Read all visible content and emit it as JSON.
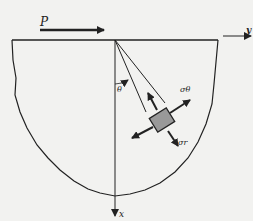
{
  "diagram": {
    "title": "",
    "labels": {
      "load": "P",
      "y_axis": "y",
      "x_axis": "x",
      "angle": "θ",
      "sigma_theta": "σθ",
      "sigma_r": "σr"
    },
    "colors": {
      "background": "#f2f2f0",
      "line": "#222222",
      "element_fill": "#999999"
    }
  }
}
